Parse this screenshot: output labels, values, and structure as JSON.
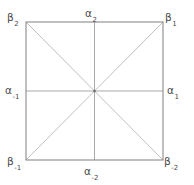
{
  "figure": {
    "type": "geometric-diagram",
    "background_color": "#ffffff",
    "border_color": "#8a8a8a",
    "diagonal_color": "#b5b5b5",
    "midline_color": "#a8a8a8",
    "center_dot_color": "#6e6e6e",
    "text_color": "#4a4a4a",
    "square": {
      "left": 26,
      "top": 22,
      "right": 163,
      "bottom": 160
    },
    "center": {
      "x": 94.5,
      "y": 91
    }
  },
  "labels": {
    "vertices": {
      "top_left": {
        "base": "β",
        "sub": "2",
        "full": "β₂"
      },
      "top_right": {
        "base": "β",
        "sub": "1",
        "full": "β₁"
      },
      "bottom_left": {
        "base": "β",
        "sub": "-1",
        "full": "β₋₁"
      },
      "bottom_right": {
        "base": "β",
        "sub": "-2",
        "full": "β₋₂"
      }
    },
    "edges": {
      "top": {
        "base": "α",
        "sub": "2",
        "full": "α₂"
      },
      "right": {
        "base": "α",
        "sub": "1",
        "full": "α₁"
      },
      "left": {
        "base": "α",
        "sub": "-1",
        "full": "α₋₁"
      },
      "bottom": {
        "base": "α",
        "sub": "-2",
        "full": "α₋₂"
      }
    }
  }
}
